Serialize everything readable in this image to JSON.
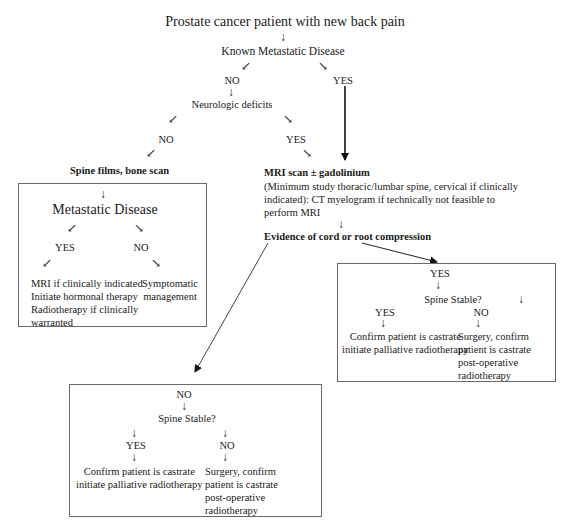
{
  "title": "Prostate cancer patient with new back pain",
  "top": {
    "known_metastatic": "Known Metastatic Disease",
    "no": "NO",
    "yes": "YES",
    "neurologic_deficits": "Neurologic deficits",
    "neuro_no": "NO",
    "neuro_yes": "YES"
  },
  "left_branch": {
    "heading": "Spine films, bone scan",
    "box": {
      "title": "Metastatic Disease",
      "yes": "YES",
      "no": "NO",
      "yes_lines": [
        "MRI if clinically indicated",
        "Initiate hormonal therapy",
        "Radiotherapy if clinically",
        "warranted"
      ],
      "no_lines": [
        "Symptomatic",
        "management"
      ]
    }
  },
  "mri": {
    "heading": "MRI scan ± gadolinium",
    "lines": [
      "(Minimum study thoracic/lumbar spine, cervical if clinically",
      "indicated): CT myelogram if technically not feasible to",
      "perform MRI"
    ],
    "evidence": "Evidence of cord or root compression"
  },
  "right_box": {
    "yes": "YES",
    "spine_stable": "Spine Stable?",
    "yes_label": "YES",
    "no_label": "NO",
    "yes_lines": [
      "Confirm patient is castrate",
      "initiate palliative radiotherapy"
    ],
    "no_lines": [
      "Surgery, confirm",
      "patient is castrate",
      "post-operative",
      "radiotherapy"
    ]
  },
  "bottom_box": {
    "no": "NO",
    "spine_stable": "Spine Stable?",
    "yes_label": "YES",
    "no_label": "NO",
    "yes_lines": [
      "Confirm patient is castrate",
      "initiate palliative radiotherapy"
    ],
    "no_lines": [
      "Surgery, confirm",
      "patient is castrate",
      "post-operative",
      "radiotherapy"
    ]
  },
  "glyphs": {
    "down": "↓",
    "down_left": "↙",
    "down_right": "↘"
  }
}
